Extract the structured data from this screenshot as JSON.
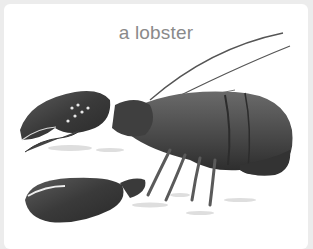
{
  "caption": "a lobster",
  "image": {
    "subject": "lobster-illustration",
    "colors": {
      "shell": "#4a4a4a",
      "shadow": "#2c2c2c",
      "highlight": "#9a9a9a",
      "background": "#ffffff",
      "page": "#ececec"
    }
  }
}
